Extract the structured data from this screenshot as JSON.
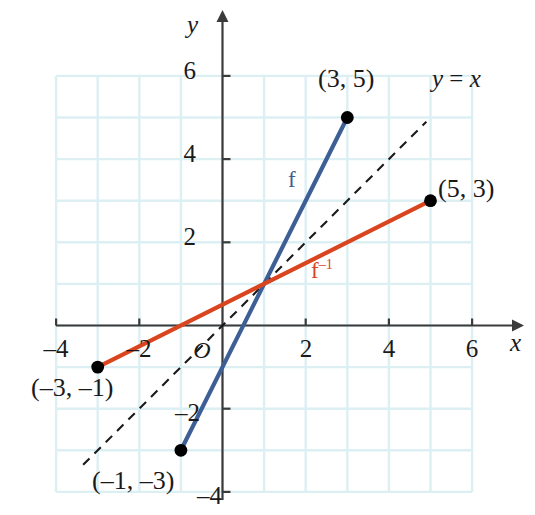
{
  "figure": {
    "kind": "coordinate-plane-graph",
    "width": 535,
    "height": 515,
    "background_color": "#ffffff"
  },
  "colors": {
    "grid": "#dcf0f3",
    "axis": "#3b3b3b",
    "function_blue": "#3d5f96",
    "inverse_red": "#d9451f",
    "dashed_line": "#1a1a1a",
    "point_fill": "#000000",
    "text": "#1a1a1a"
  },
  "axes": {
    "x_label": "x",
    "y_label": "y",
    "origin_label": "O",
    "x_ticks": [
      {
        "value": -4,
        "label": "–4"
      },
      {
        "value": -2,
        "label": "–2"
      },
      {
        "value": 2,
        "label": "2"
      },
      {
        "value": 4,
        "label": "4"
      },
      {
        "value": 6,
        "label": "6"
      }
    ],
    "y_ticks": [
      {
        "value": 6,
        "label": "6"
      },
      {
        "value": 4,
        "label": "4"
      },
      {
        "value": 2,
        "label": "2"
      },
      {
        "value": -2,
        "label": "–2"
      },
      {
        "value": -4,
        "label": "–4"
      }
    ],
    "x_range": [
      -4.6,
      6.9
    ],
    "y_range": [
      -4.4,
      6.6
    ],
    "grid": true,
    "grid_step": 1,
    "grid_x_range": [
      -4,
      6
    ],
    "grid_y_range": [
      -4,
      6
    ]
  },
  "chart_data": {
    "type": "line",
    "title": "",
    "xlabel": "x",
    "ylabel": "y",
    "xlim": [
      -4.6,
      6.9
    ],
    "ylim": [
      -4.4,
      6.6
    ],
    "grid": true,
    "legend_position": "inline-annotations",
    "series": [
      {
        "name": "f",
        "label": "f",
        "color": "#3d5f96",
        "style": "solid",
        "x": [
          -1,
          3
        ],
        "y": [
          -3,
          5
        ],
        "endpoints_filled": true
      },
      {
        "name": "f-inverse",
        "label": "f⁻¹",
        "color": "#d9451f",
        "style": "solid",
        "x": [
          -3,
          5
        ],
        "y": [
          -1,
          3
        ],
        "endpoints_filled": true
      },
      {
        "name": "y = x",
        "label": "y = x",
        "color": "#1a1a1a",
        "style": "dashed",
        "x": [
          -3.35,
          4.9
        ],
        "y": [
          -3.35,
          4.9
        ],
        "endpoints_filled": false
      }
    ],
    "points": [
      {
        "x": 3,
        "y": 5,
        "label": "(3, 5)",
        "series": "f"
      },
      {
        "x": -1,
        "y": -3,
        "label": "(–1, –3)",
        "series": "f"
      },
      {
        "x": 5,
        "y": 3,
        "label": "(5, 3)",
        "series": "f-inverse"
      },
      {
        "x": -3,
        "y": -1,
        "label": "(–3, –1)",
        "series": "f-inverse"
      }
    ],
    "annotations": [
      {
        "text": "f",
        "x": 1.75,
        "y": 3.0,
        "color": "#3d5f96"
      },
      {
        "text": "f⁻¹",
        "x": 2.25,
        "y": 1.35,
        "color": "#d9451f"
      },
      {
        "text": "y = x",
        "x": 5.2,
        "y": 5.3,
        "color": "#1a1a1a"
      }
    ]
  },
  "labels": {
    "point_3_5": "(3, 5)",
    "point_5_3": "(5, 3)",
    "point_neg3_neg1": "(–3, –1)",
    "point_neg1_neg3": "(–1, –3)",
    "f": "f",
    "f_inverse_base": "f",
    "f_inverse_exp": "–1",
    "y_equals_x_lhs": "y",
    "y_equals_x_op": " = ",
    "y_equals_x_rhs": "x"
  }
}
